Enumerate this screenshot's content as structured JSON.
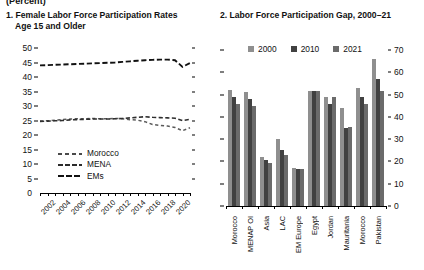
{
  "supertitle": "(Percent)",
  "panels": [
    {
      "title_line1": "1. Female Labor Force Participation Rates",
      "title_line2": "Age 15 and Older"
    },
    {
      "title": "2. Labor Force Participation Gap, 2000–21"
    }
  ],
  "legend_left": [
    {
      "label": "Morocco",
      "style": "dash-morocco"
    },
    {
      "label": "MENA",
      "style": "dash-mena"
    },
    {
      "label": "EMs",
      "style": "dash-ems"
    }
  ],
  "legend_right": [
    {
      "label": "2000",
      "color": "#8f8f8f"
    },
    {
      "label": "2010",
      "color": "#414141"
    },
    {
      "label": "2021",
      "color": "#6b6b6b"
    }
  ],
  "chart_data": [
    {
      "type": "line",
      "title": "1. Female Labor Force Participation Rates Age 15 and Older",
      "xlabel": "",
      "ylabel": "Percent",
      "ylim": [
        0,
        50
      ],
      "yticks": [
        0,
        5,
        10,
        15,
        20,
        25,
        30,
        35,
        40,
        45,
        50
      ],
      "xticklabels": [
        "2002",
        "2004",
        "2006",
        "2008",
        "2010",
        "2012",
        "2014",
        "2016",
        "2018",
        "2020"
      ],
      "x": [
        2001,
        2002,
        2003,
        2004,
        2005,
        2006,
        2007,
        2008,
        2009,
        2010,
        2011,
        2012,
        2013,
        2014,
        2015,
        2016,
        2017,
        2018,
        2019,
        2020,
        2021
      ],
      "grid": false,
      "legend_position": "lower-left",
      "series": [
        {
          "name": "Morocco",
          "values": [
            24.8,
            24.9,
            25.1,
            25.3,
            25.5,
            25.6,
            25.6,
            25.7,
            25.6,
            25.6,
            25.7,
            25.6,
            25.3,
            25.1,
            24.6,
            23.6,
            23.3,
            23.1,
            22.6,
            21.5,
            22.5
          ]
        },
        {
          "name": "MENA",
          "values": [
            24.7,
            24.8,
            24.9,
            25.0,
            25.2,
            25.3,
            25.4,
            25.5,
            25.5,
            25.5,
            25.6,
            25.7,
            25.9,
            26.1,
            26.3,
            26.1,
            26.0,
            25.9,
            25.8,
            25.0,
            25.4
          ]
        },
        {
          "name": "EMs",
          "values": [
            44.0,
            44.1,
            44.2,
            44.3,
            44.4,
            44.5,
            44.6,
            44.7,
            44.8,
            44.9,
            45.0,
            45.2,
            45.4,
            45.6,
            45.8,
            45.9,
            46.0,
            46.0,
            45.8,
            43.5,
            44.8
          ]
        }
      ]
    },
    {
      "type": "bar",
      "title": "2. Labor Force Participation Gap, 2000–21",
      "xlabel": "",
      "ylabel": "",
      "ylim": [
        0,
        70
      ],
      "yticks": [
        0,
        10,
        20,
        30,
        40,
        50,
        60,
        70
      ],
      "categories": [
        "Morocco",
        "MENAP OI",
        "Asia",
        "LAC",
        "EM Europe",
        "Egypt",
        "Jordan",
        "Mauritania",
        "Morocco",
        "Pakistan"
      ],
      "grid": false,
      "legend_position": "top",
      "series": [
        {
          "name": "2000",
          "values": [
            52.0,
            51.0,
            22.0,
            30.0,
            17.0,
            51.5,
            49.0,
            44.0,
            53.0,
            66.0
          ]
        },
        {
          "name": "2010",
          "values": [
            49.0,
            48.0,
            20.5,
            25.0,
            16.5,
            51.5,
            46.0,
            35.0,
            49.0,
            57.0
          ]
        },
        {
          "name": "2021",
          "values": [
            46.0,
            45.0,
            19.5,
            23.0,
            16.5,
            51.5,
            49.0,
            35.5,
            46.0,
            51.5
          ]
        }
      ]
    }
  ]
}
